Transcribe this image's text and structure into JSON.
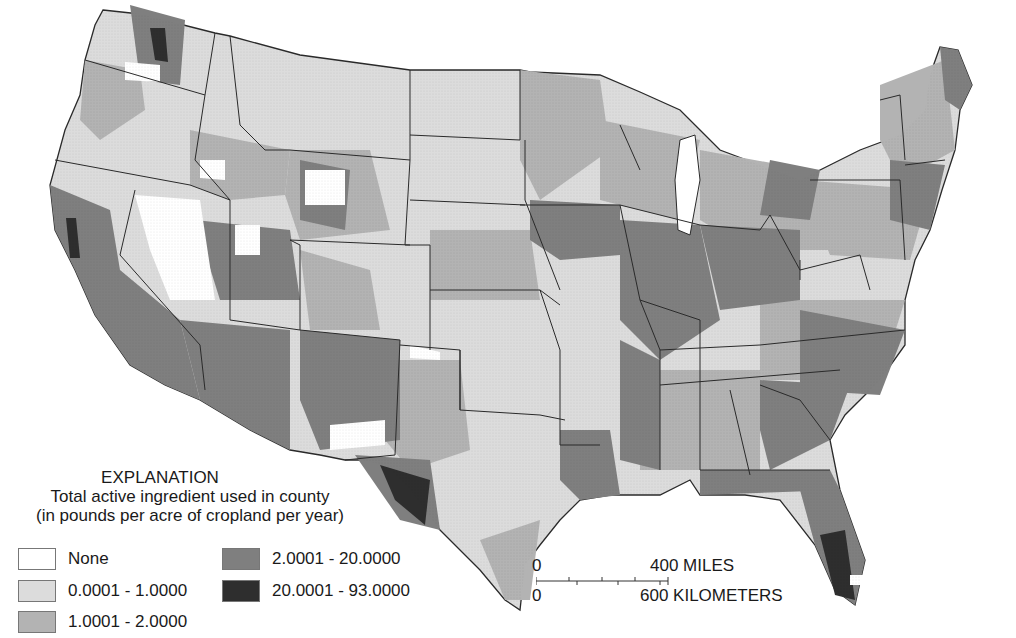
{
  "legend": {
    "heading": "EXPLANATION",
    "subtitle_1": "Total active ingredient used in county",
    "subtitle_2": "(in pounds per acre of cropland per year)",
    "classes": [
      {
        "label": "None",
        "color": "#ffffff"
      },
      {
        "label": "0.0001 - 1.0000",
        "color": "#dcdcdc"
      },
      {
        "label": "1.0001 - 2.0000",
        "color": "#b3b3b3"
      },
      {
        "label": "2.0001 - 20.0000",
        "color": "#7f7f7f"
      },
      {
        "label": "20.0001 - 93.0000",
        "color": "#2e2e2e"
      }
    ]
  },
  "scale_bar": {
    "miles_zero": "0",
    "miles_label": "400 MILES",
    "km_zero": "0",
    "km_label": "600 KILOMETERS"
  },
  "colors": {
    "none": "#ffffff",
    "low": "#dcdcdc",
    "mid": "#b3b3b3",
    "high": "#7f7f7f",
    "very_high": "#2e2e2e",
    "border": "#2a2a2a"
  }
}
